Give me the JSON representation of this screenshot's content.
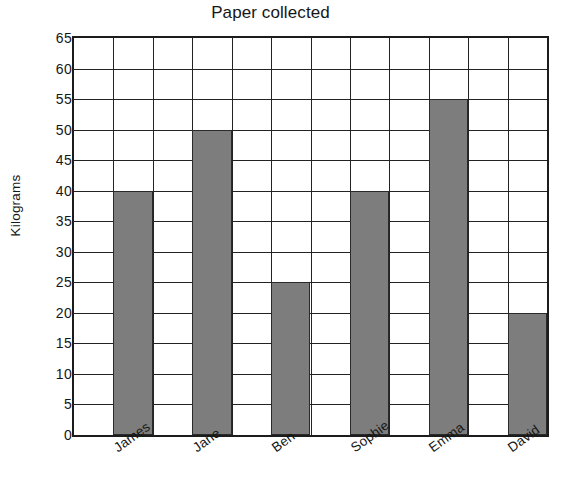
{
  "chart_data": {
    "type": "bar",
    "title": "Paper collected",
    "xlabel": "",
    "ylabel": "Kilograms",
    "categories": [
      "James",
      "Jane",
      "Ben",
      "Sophie",
      "Emma",
      "David"
    ],
    "values": [
      40,
      50,
      25,
      40,
      55,
      20
    ],
    "ylim": [
      0,
      65
    ],
    "ytick_step": 5,
    "ytick_labels": [
      "0",
      "5",
      "10",
      "15",
      "20",
      "25",
      "30",
      "35",
      "40",
      "45",
      "50",
      "55",
      "60",
      "65"
    ],
    "ytick_values": [
      0,
      5,
      10,
      15,
      20,
      25,
      30,
      35,
      40,
      45,
      50,
      55,
      60,
      65
    ],
    "grid": "both",
    "vertical_gridline_count": 12,
    "legend": null,
    "legend_position": "none",
    "bar_color": "#7d7d7d",
    "bar_edge_color": "#2a2a2a",
    "axis_color": "#1c1c1c",
    "grid_color": "#232323",
    "background_color": "#ffffff",
    "bar_column_indices": [
      1,
      3,
      5,
      7,
      9,
      11
    ],
    "label_rotation_deg": -36
  }
}
